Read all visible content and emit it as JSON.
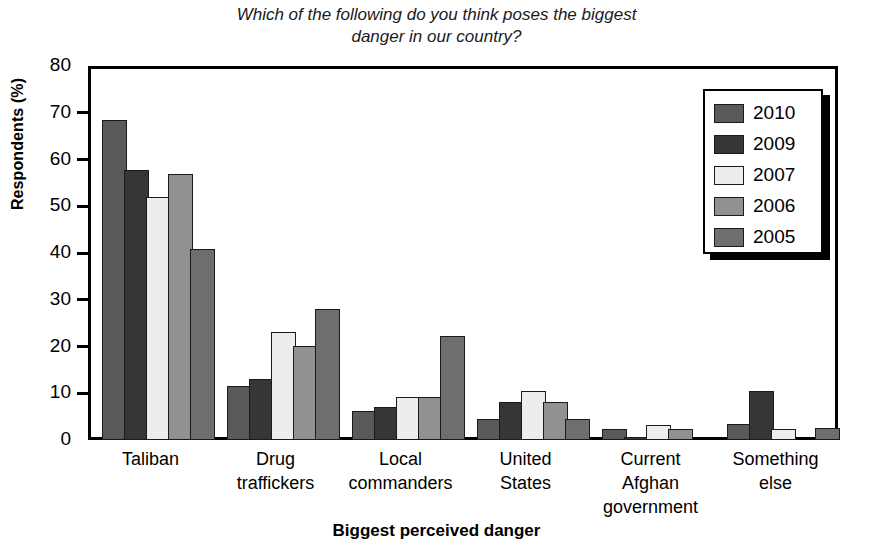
{
  "chart_data": {
    "type": "bar",
    "title": "Which of the following do you think poses the biggest\ndanger in our country?",
    "xlabel": "Biggest perceived danger",
    "ylabel": "Respondents (%)",
    "ylim": [
      0,
      80
    ],
    "yticks": [
      0,
      10,
      20,
      30,
      40,
      50,
      60,
      70,
      80
    ],
    "grid": false,
    "legend_position": "top-right",
    "categories": [
      "Taliban",
      "Drug\ntraffickers",
      "Local\ncommanders",
      "United\nStates",
      "Current\nAfghan\ngovernment",
      "Something\nelse"
    ],
    "series": [
      {
        "name": "2010",
        "color": "#5a5a5a",
        "values": [
          68.5,
          11.5,
          6.3,
          4.5,
          2.3,
          3.5
        ]
      },
      {
        "name": "2009",
        "color": "#363636",
        "values": [
          57.8,
          13.1,
          7.0,
          8.1,
          0.7,
          10.5
        ]
      },
      {
        "name": "2007",
        "color": "#ededed",
        "values": [
          52.0,
          23.2,
          9.3,
          10.4,
          3.3,
          2.3
        ]
      },
      {
        "name": "2006",
        "color": "#919191",
        "values": [
          57.0,
          20.2,
          9.3,
          8.2,
          2.4,
          0
        ]
      },
      {
        "name": "2005",
        "color": "#6e6e6e",
        "values": [
          40.8,
          28.0,
          22.3,
          4.5,
          0,
          2.5
        ]
      }
    ]
  },
  "legend": {
    "items": [
      {
        "label": "2010"
      },
      {
        "label": "2009"
      },
      {
        "label": "2007"
      },
      {
        "label": "2006"
      },
      {
        "label": "2005"
      }
    ]
  }
}
